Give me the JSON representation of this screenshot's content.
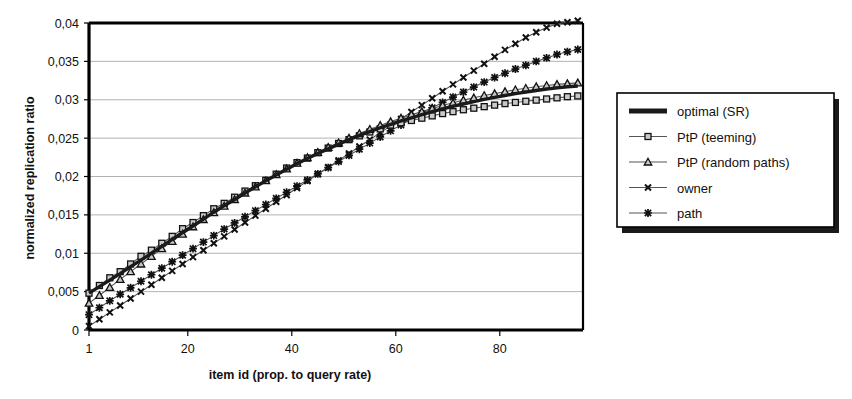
{
  "chart_data": {
    "type": "line",
    "title": "",
    "xlabel": "item id (prop. to query rate)",
    "ylabel": "normalized replication ratio",
    "xlim": [
      1,
      96
    ],
    "ylim": [
      0,
      0.04
    ],
    "grid": true,
    "legend_position": "right-outside",
    "x_ticks": [
      "1",
      "20",
      "40",
      "60",
      "80"
    ],
    "x_tick_values": [
      1,
      20,
      40,
      60,
      80
    ],
    "y_ticks": [
      "0",
      "0,005",
      "0,01",
      "0,015",
      "0,02",
      "0,025",
      "0,03",
      "0,035",
      "0,04"
    ],
    "y_tick_values": [
      0,
      0.005,
      0.01,
      0.015,
      0.02,
      0.025,
      0.03,
      0.035,
      0.04
    ],
    "decimal_separator": ",",
    "x": [
      1,
      3,
      5,
      7,
      9,
      11,
      13,
      15,
      17,
      19,
      21,
      23,
      25,
      27,
      29,
      31,
      33,
      35,
      37,
      39,
      41,
      43,
      45,
      47,
      49,
      51,
      53,
      55,
      57,
      59,
      61,
      63,
      65,
      67,
      69,
      71,
      73,
      75,
      77,
      79,
      81,
      83,
      85,
      87,
      89,
      91,
      93,
      95
    ],
    "series": [
      {
        "name": "optimal (SR)",
        "marker": "none",
        "line": "thick-solid",
        "color": "#1a1a1a",
        "values": [
          0.0048,
          0.00565,
          0.0065,
          0.00735,
          0.00825,
          0.0091,
          0.01,
          0.0109,
          0.0118,
          0.0127,
          0.01355,
          0.01445,
          0.01535,
          0.0162,
          0.017,
          0.01785,
          0.01865,
          0.01945,
          0.0202,
          0.02095,
          0.02165,
          0.02235,
          0.023,
          0.0236,
          0.0242,
          0.0248,
          0.02535,
          0.02585,
          0.02635,
          0.0268,
          0.02725,
          0.02765,
          0.02805,
          0.02845,
          0.0288,
          0.02915,
          0.02945,
          0.02975,
          0.03005,
          0.0303,
          0.03055,
          0.0308,
          0.031,
          0.0312,
          0.0314,
          0.03155,
          0.0317,
          0.0318
        ]
      },
      {
        "name": "PtP (teeming)",
        "marker": "square",
        "line": "thin-solid",
        "color": "#555555",
        "values": [
          0.0048,
          0.0058,
          0.0068,
          0.0076,
          0.0086,
          0.0096,
          0.0104,
          0.0113,
          0.0122,
          0.0132,
          0.014,
          0.0149,
          0.0158,
          0.0165,
          0.0173,
          0.0181,
          0.0188,
          0.0195,
          0.0203,
          0.0211,
          0.0218,
          0.0224,
          0.0231,
          0.0237,
          0.0243,
          0.0248,
          0.0253,
          0.0258,
          0.0262,
          0.0267,
          0.027,
          0.0273,
          0.0276,
          0.0279,
          0.0282,
          0.02845,
          0.0287,
          0.0289,
          0.0291,
          0.0293,
          0.0295,
          0.02965,
          0.0298,
          0.02995,
          0.0301,
          0.03025,
          0.0304,
          0.0305
        ]
      },
      {
        "name": "PtP (random paths)",
        "marker": "triangle",
        "line": "thin-solid",
        "color": "#555555",
        "values": [
          0.0035,
          0.0045,
          0.00555,
          0.0066,
          0.0076,
          0.0086,
          0.0096,
          0.0106,
          0.01155,
          0.0125,
          0.01345,
          0.0144,
          0.0153,
          0.01615,
          0.017,
          0.01785,
          0.01865,
          0.01945,
          0.02025,
          0.021,
          0.02175,
          0.02245,
          0.02315,
          0.0238,
          0.0244,
          0.025,
          0.0256,
          0.02615,
          0.02665,
          0.02715,
          0.0276,
          0.02805,
          0.02845,
          0.02885,
          0.02925,
          0.0296,
          0.02995,
          0.03025,
          0.03055,
          0.0308,
          0.03105,
          0.0313,
          0.0315,
          0.0317,
          0.03185,
          0.032,
          0.0321,
          0.0322
        ]
      },
      {
        "name": "owner",
        "marker": "x",
        "line": "thin-solid",
        "color": "#555555",
        "values": [
          0.0005,
          0.0014,
          0.0023,
          0.0032,
          0.0041,
          0.005,
          0.0059,
          0.0068,
          0.0077,
          0.0086,
          0.0095,
          0.0104,
          0.0113,
          0.0122,
          0.0131,
          0.014,
          0.0149,
          0.0158,
          0.0167,
          0.0176,
          0.0185,
          0.0194,
          0.0203,
          0.0212,
          0.0221,
          0.023,
          0.0239,
          0.0248,
          0.0257,
          0.0266,
          0.0275,
          0.0284,
          0.0293,
          0.0302,
          0.0311,
          0.032,
          0.0329,
          0.0338,
          0.0347,
          0.0356,
          0.0365,
          0.0373,
          0.0381,
          0.0388,
          0.0394,
          0.0399,
          0.0401,
          0.0403
        ]
      },
      {
        "name": "path",
        "marker": "star",
        "line": "thin-solid",
        "color": "#555555",
        "values": [
          0.002,
          0.0029,
          0.0038,
          0.00465,
          0.0055,
          0.00635,
          0.0072,
          0.00805,
          0.0089,
          0.00975,
          0.0106,
          0.01145,
          0.0123,
          0.01315,
          0.01395,
          0.01475,
          0.01555,
          0.01635,
          0.01715,
          0.01795,
          0.01875,
          0.01955,
          0.02035,
          0.02115,
          0.02195,
          0.02275,
          0.02355,
          0.02435,
          0.02515,
          0.02595,
          0.0267,
          0.02745,
          0.0282,
          0.02895,
          0.02965,
          0.03035,
          0.031,
          0.03165,
          0.0323,
          0.0329,
          0.03345,
          0.034,
          0.0345,
          0.035,
          0.03545,
          0.0359,
          0.03625,
          0.03655
        ]
      }
    ]
  },
  "legend": {
    "entries": [
      {
        "label": "optimal (SR)"
      },
      {
        "label": "PtP (teeming)"
      },
      {
        "label": "PtP (random paths)"
      },
      {
        "label": "owner"
      },
      {
        "label": "path"
      }
    ]
  },
  "colors": {
    "line": "#1a1a1a",
    "thin_line": "#555555",
    "grid": "#a9a9a9",
    "axis": "#000000",
    "marker_fill": "#c9c9c9",
    "background": "#ffffff"
  }
}
